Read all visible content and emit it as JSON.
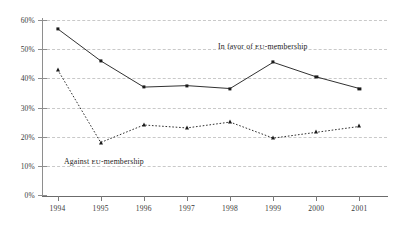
{
  "chart_data": {
    "type": "line",
    "title": "",
    "subtitle": "",
    "xlabel": "",
    "ylabel": "",
    "categories": [
      "1994",
      "1995",
      "1996",
      "1997",
      "1998",
      "1999",
      "2000",
      "2001"
    ],
    "ylim": [
      0,
      60
    ],
    "ytick_values": [
      0,
      10,
      20,
      30,
      40,
      50,
      60
    ],
    "ytick_labels": [
      "0%",
      "10%",
      "20%",
      "30%",
      "40%",
      "50%",
      "60%"
    ],
    "grid": true,
    "grid_style": "dashed-horizontal",
    "legend_position": "inline-annotations",
    "series": [
      {
        "name": "In favor of EU-membership",
        "label_prefix": "In favor of ",
        "label_smallcaps": "EU",
        "label_suffix": "-membership",
        "style": "solid",
        "marker": "square",
        "color": "#1a1a1a",
        "values": [
          57,
          46,
          37,
          37.5,
          36.5,
          45.5,
          40.5,
          36.5
        ]
      },
      {
        "name": "Against EU-membership",
        "label_prefix": "Against ",
        "label_smallcaps": "EU",
        "label_suffix": "-membership",
        "style": "dotted",
        "marker": "triangle",
        "color": "#1a1a1a",
        "values": [
          43,
          18,
          24,
          23,
          25,
          19.5,
          21.5,
          23.5
        ]
      }
    ]
  }
}
